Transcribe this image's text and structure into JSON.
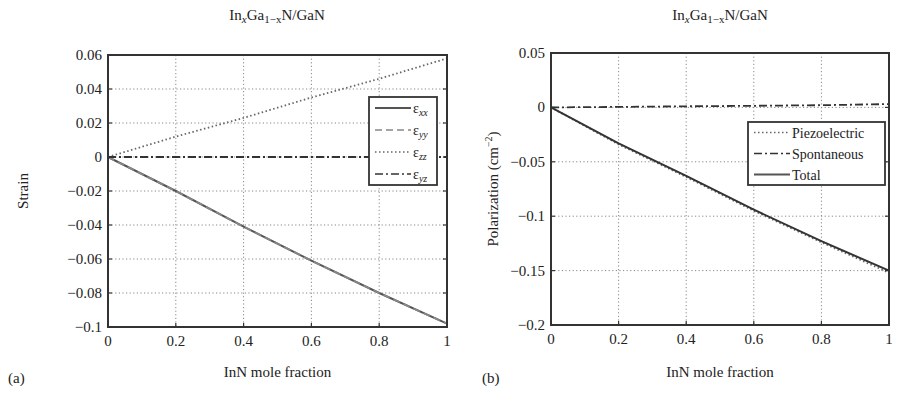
{
  "chart_data": [
    {
      "panel": "(a)",
      "type": "line",
      "title": "InxGa1-xN/GaN",
      "title_parts": {
        "a": "In",
        "b": "x",
        "c": "Ga",
        "d": "1−x",
        "e": "N/GaN"
      },
      "xlabel": "InN mole fraction",
      "ylabel": "Strain",
      "xlim": [
        0,
        1
      ],
      "ylim": [
        -0.1,
        0.06
      ],
      "xticks": [
        "0",
        "0.2",
        "0.4",
        "0.6",
        "0.8",
        "1"
      ],
      "yticks": [
        "0.06",
        "0.04",
        "0.02",
        "0",
        "−0.02",
        "−0.04",
        "−0.06",
        "−0.08",
        "−0.1"
      ],
      "grid": true,
      "legend_position": "right-inside",
      "x": [
        0,
        0.2,
        0.4,
        0.6,
        0.8,
        1.0
      ],
      "series": [
        {
          "name": "εxx",
          "sym": "ε",
          "sub": "xx",
          "style": "solid",
          "values": [
            0,
            -0.02,
            -0.041,
            -0.061,
            -0.08,
            -0.098
          ]
        },
        {
          "name": "εyy",
          "sym": "ε",
          "sub": "yy",
          "style": "dashed",
          "values": [
            0,
            -0.02,
            -0.041,
            -0.061,
            -0.08,
            -0.098
          ]
        },
        {
          "name": "εzz",
          "sym": "ε",
          "sub": "zz",
          "style": "dotted",
          "values": [
            0,
            0.012,
            0.023,
            0.035,
            0.046,
            0.058
          ]
        },
        {
          "name": "εyz",
          "sym": "ε",
          "sub": "yz",
          "style": "dashdot",
          "values": [
            0,
            0,
            0,
            0,
            0,
            0
          ]
        }
      ]
    },
    {
      "panel": "(b)",
      "type": "line",
      "title": "InxGa1-xN/GaN",
      "title_parts": {
        "a": "In",
        "b": "x",
        "c": "Ga",
        "d": "1−x",
        "e": "N/GaN"
      },
      "xlabel": "InN mole fraction",
      "ylabel": "Polarization (cm⁻²)",
      "ylabel_parts": {
        "main": "Polarization (cm",
        "sup": "−2",
        "end": ")"
      },
      "xlim": [
        0,
        1
      ],
      "ylim": [
        -0.2,
        0.05
      ],
      "xticks": [
        "0",
        "0.2",
        "0.4",
        "0.6",
        "0.8",
        "1"
      ],
      "yticks": [
        "0.05",
        "0",
        "−0.05",
        "−0.1",
        "−0.15",
        "−0.2"
      ],
      "grid": true,
      "legend_position": "right-inside",
      "x": [
        0,
        0.2,
        0.4,
        0.6,
        0.8,
        1.0
      ],
      "series": [
        {
          "name": "Piezoelectric",
          "style": "dotted",
          "values": [
            0,
            -0.034,
            -0.064,
            -0.095,
            -0.124,
            -0.152
          ]
        },
        {
          "name": "Spontaneous",
          "style": "dashdot",
          "values": [
            0,
            0.0005,
            0.001,
            0.0015,
            0.002,
            0.003
          ]
        },
        {
          "name": "Total",
          "style": "solid",
          "values": [
            0,
            -0.033,
            -0.063,
            -0.094,
            -0.123,
            -0.15
          ]
        }
      ]
    }
  ]
}
